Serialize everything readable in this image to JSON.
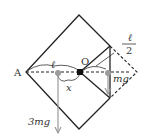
{
  "diagram": {
    "labels": {
      "pivot": "O",
      "left_vertex": "A",
      "length_l": "ℓ",
      "half_num": "ℓ",
      "half_den": "2",
      "distance_x": "x",
      "force_small": "mg",
      "force_large": "3mg"
    },
    "colors": {
      "outline": "#222222",
      "force_arrow": "#9a9a9a",
      "pivot": "#111111"
    }
  }
}
